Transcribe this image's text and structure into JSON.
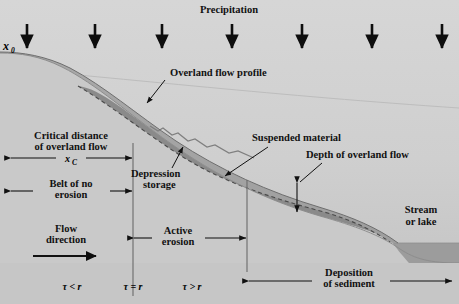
{
  "figure": {
    "width": 459,
    "height": 304
  },
  "colors": {
    "sky": "#d2d2d2",
    "ground": "#c9c9c9",
    "flow_band": "#a5a5a5",
    "suspended": "#8a8a8a",
    "water_body": "#9a9a9a",
    "lower_panel": "#c7c7c7",
    "ink": "#111111",
    "rule": "#6b6b6b"
  },
  "labels": {
    "precipitation": "Precipitation",
    "x0": "x",
    "x0_sub": "0",
    "overland_flow_profile": "Overland flow profile",
    "suspended_material": "Suspended material",
    "depth_of_overland_flow": "Depth of overland flow",
    "depression_storage_line1": "Depression",
    "depression_storage_line2": "storage",
    "critical_distance_line1": "Critical distance",
    "critical_distance_line2": "of overland flow",
    "xc": "x",
    "xc_sub": "C",
    "belt_line1": "Belt of no",
    "belt_line2": "erosion",
    "flow_direction_line1": "Flow",
    "flow_direction_line2": "direction",
    "active_erosion_line1": "Active",
    "active_erosion_line2": "erosion",
    "deposition_line1": "Deposition",
    "deposition_line2": "of sediment",
    "stream_line1": "Stream",
    "stream_line2": "or lake",
    "tau_less": "τ < r",
    "tau_equal": "τ = r",
    "tau_greater": "τ > r"
  },
  "precipitation_arrows": {
    "count": 7,
    "x_positions": [
      27,
      95,
      162,
      232,
      302,
      372,
      442
    ],
    "y_top": 24,
    "y_bottom": 50
  },
  "geometry": {
    "ground_surface": "M 0,53 C 20,53 40,56 62,67 C 96,84 130,115 170,143 C 215,175 265,200 320,216 C 355,226 380,235 400,249 C 415,259 430,263 459,263",
    "flow_top": "M 0,52 C 22,52 46,56 70,68 C 104,86 136,114 176,141 C 220,170 268,192 322,208 C 352,217 378,228 398,243",
    "suspension_dash": "M 78,86 C 112,106 146,134 186,159 C 228,184 272,198 324,212",
    "water_line_y": 243,
    "divider_x_positions": [
      133,
      247
    ],
    "lower_panel_top": 263,
    "faint_horizon": "M 0,68 C 120,78 280,96 459,108"
  },
  "dimensions": [
    {
      "name": "critical-distance",
      "y": 155,
      "x_start": 10,
      "x_end": 133,
      "label_gap_start": 40,
      "label_gap_end": 100
    },
    {
      "name": "belt-of-no-erosion",
      "y": 192,
      "x_start": 10,
      "x_end": 133,
      "label_gap_start": 30,
      "label_gap_end": 112
    },
    {
      "name": "active-erosion",
      "y": 238,
      "x_start": 116,
      "x_end": 247,
      "label_gap_start": 150,
      "label_gap_end": 205
    },
    {
      "name": "deposition-of-sediment",
      "y": 280,
      "x_start": 253,
      "x_end": 450,
      "label_gap_start": 310,
      "label_gap_end": 390
    }
  ],
  "depth_arrow": {
    "x": 297,
    "y_top": 183,
    "y_bottom": 212
  },
  "leaders": [
    {
      "name": "overland-flow-profile-leader",
      "path": "M 163,81 L 146,104"
    },
    {
      "name": "suspended-material-leader",
      "path": "M 268,151 L 224,177"
    },
    {
      "name": "depth-of-overland-flow-leader",
      "path": "M 322,160 L 299,181"
    },
    {
      "name": "depression-storage-leader",
      "path": "M 172,167 L 182,146"
    }
  ],
  "flow_direction_arrow": {
    "x_start": 33,
    "x_end": 97,
    "y": 256
  },
  "tau_markers": [
    {
      "label_key": "tau_less",
      "x": 72,
      "y": 288
    },
    {
      "label_key": "tau_equal",
      "x": 133,
      "y": 288
    },
    {
      "label_key": "tau_greater",
      "x": 192,
      "y": 288
    }
  ]
}
